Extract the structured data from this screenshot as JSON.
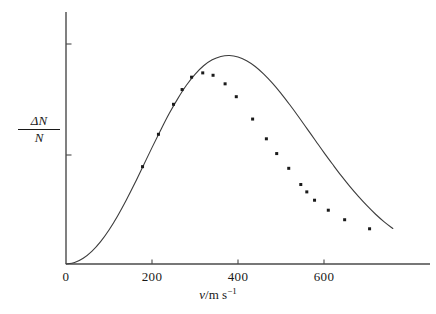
{
  "figure": {
    "background_color": "#ffffff",
    "axis_color": "#4a4a4a",
    "curve_color": "#3c3c3c",
    "marker_color": "#1a1a1a"
  },
  "axes": {
    "x": {
      "label_numerator": "v",
      "label_denominator": "m s",
      "label_exponent": "−1",
      "label_full": "v/m s⁻¹",
      "tick_labels": [
        "0",
        "200",
        "400",
        "600"
      ],
      "tick_values": [
        0,
        200,
        400,
        600
      ],
      "range": [
        0,
        760
      ]
    },
    "y": {
      "label_numerator": "ΔN",
      "label_denominator": "N",
      "label_full": "ΔN/N",
      "tick_labels": [
        "",
        ""
      ],
      "tick_values": [
        0.84,
        0.44
      ],
      "range": [
        0,
        1.06
      ]
    }
  },
  "chart_data": {
    "type": "line",
    "title": "",
    "subtitle": "",
    "xlabel": "v/m s⁻¹",
    "ylabel": "ΔN/N",
    "xlim": [
      0,
      760
    ],
    "ylim": [
      0,
      1.06
    ],
    "grid": false,
    "legend": false,
    "legend_position": "none",
    "annotations": [],
    "series": [
      {
        "name": "Maxwell–Boltzmann speed distribution (fitted curve)",
        "kind": "line",
        "x": [
          0,
          20,
          40,
          60,
          80,
          100,
          120,
          140,
          160,
          180,
          200,
          220,
          240,
          260,
          280,
          300,
          320,
          340,
          360,
          380,
          400,
          420,
          440,
          460,
          480,
          500,
          520,
          540,
          560,
          580,
          600,
          620,
          640,
          660,
          680,
          700,
          720,
          740,
          760
        ],
        "y": [
          0.0,
          0.006,
          0.024,
          0.053,
          0.093,
          0.143,
          0.202,
          0.268,
          0.339,
          0.414,
          0.489,
          0.562,
          0.632,
          0.695,
          0.751,
          0.797,
          0.833,
          0.858,
          0.872,
          0.876,
          0.87,
          0.854,
          0.83,
          0.798,
          0.76,
          0.717,
          0.67,
          0.621,
          0.57,
          0.519,
          0.468,
          0.419,
          0.371,
          0.326,
          0.284,
          0.245,
          0.209,
          0.177,
          0.149
        ]
      },
      {
        "name": "Measured data points",
        "kind": "scatter",
        "points": [
          {
            "x": 178,
            "y": 0.409
          },
          {
            "x": 215,
            "y": 0.545
          },
          {
            "x": 250,
            "y": 0.671
          },
          {
            "x": 270,
            "y": 0.733
          },
          {
            "x": 292,
            "y": 0.785
          },
          {
            "x": 318,
            "y": 0.803
          },
          {
            "x": 342,
            "y": 0.793
          },
          {
            "x": 370,
            "y": 0.757
          },
          {
            "x": 396,
            "y": 0.703
          },
          {
            "x": 434,
            "y": 0.609
          },
          {
            "x": 466,
            "y": 0.526
          },
          {
            "x": 490,
            "y": 0.464
          },
          {
            "x": 518,
            "y": 0.402
          },
          {
            "x": 546,
            "y": 0.334
          },
          {
            "x": 560,
            "y": 0.303
          },
          {
            "x": 578,
            "y": 0.268
          },
          {
            "x": 610,
            "y": 0.226
          },
          {
            "x": 648,
            "y": 0.186
          },
          {
            "x": 706,
            "y": 0.148
          }
        ]
      }
    ]
  },
  "geometry": {
    "origin_px": {
      "x": 66,
      "y": 264
    },
    "x_pixels_per_unit": 0.43,
    "y_axis_top_px": 12,
    "y_unit_px": 238,
    "curve_end_px": 424,
    "x_axis_end_px": 430,
    "y_tick_px": [
      44,
      155
    ],
    "marker_size_px": 3
  }
}
